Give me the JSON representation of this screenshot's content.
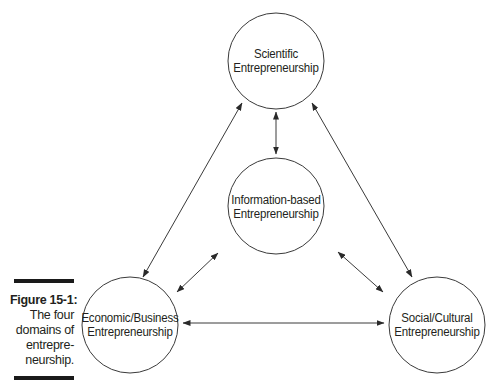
{
  "figure": {
    "number_label": "Figure 15-1:",
    "caption_lines": [
      "The four",
      "domains of",
      "entrepre-",
      "neurship."
    ]
  },
  "nodes": {
    "scientific": {
      "line1": "Scientific",
      "line2": "Entrepreneurship"
    },
    "information": {
      "line1": "Information-based",
      "line2": "Entrepreneurship"
    },
    "economic": {
      "line1": "Economic/Business",
      "line2": "Entrepreneurship"
    },
    "social": {
      "line1": "Social/Cultural",
      "line2": "Entrepreneurship"
    }
  },
  "connections": [
    {
      "from": "Scientific Entrepreneurship",
      "to": "Information-based Entrepreneurship",
      "type": "bidirectional"
    },
    {
      "from": "Scientific Entrepreneurship",
      "to": "Economic/Business Entrepreneurship",
      "type": "bidirectional"
    },
    {
      "from": "Scientific Entrepreneurship",
      "to": "Social/Cultural Entrepreneurship",
      "type": "bidirectional"
    },
    {
      "from": "Information-based Entrepreneurship",
      "to": "Economic/Business Entrepreneurship",
      "type": "bidirectional"
    },
    {
      "from": "Information-based Entrepreneurship",
      "to": "Social/Cultural Entrepreneurship",
      "type": "bidirectional"
    },
    {
      "from": "Economic/Business Entrepreneurship",
      "to": "Social/Cultural Entrepreneurship",
      "type": "bidirectional"
    }
  ],
  "colors": {
    "stroke": "#3a3a3a",
    "text": "#231f20",
    "bar": "#1a1a1a",
    "background": "#ffffff"
  }
}
